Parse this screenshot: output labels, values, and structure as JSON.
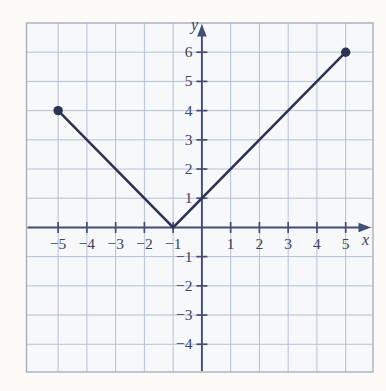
{
  "figure": {
    "width": 386,
    "height": 391,
    "background": "#fcfbf7",
    "paper_color": "#f6f8fa",
    "frame_color": "#a8aeba",
    "grid_color": "#b5c0d7",
    "axis_color": "#434d75",
    "tick_color": "#434d75",
    "curve_color": "#2d3255",
    "label_color": "#3b425f",
    "plot": {
      "left": 26.5,
      "top": 23,
      "right": 373,
      "bottom": 372
    }
  },
  "chart_data": {
    "type": "line",
    "title": "",
    "xlabel": "x",
    "ylabel": "y",
    "grid": true,
    "legend_position": "none",
    "x_axis": {
      "min": -6.1,
      "max": 5.95,
      "ticks": [
        {
          "v": -5,
          "label": "−5"
        },
        {
          "v": -4,
          "label": "−4"
        },
        {
          "v": -3,
          "label": "−3"
        },
        {
          "v": -2,
          "label": "−2"
        },
        {
          "v": -1,
          "label": "−1"
        },
        {
          "v": 1,
          "label": "1"
        },
        {
          "v": 2,
          "label": "2"
        },
        {
          "v": 3,
          "label": "3"
        },
        {
          "v": 4,
          "label": "4"
        },
        {
          "v": 5,
          "label": "5"
        }
      ]
    },
    "y_axis": {
      "min": -4.95,
      "max": 7.0,
      "ticks": [
        {
          "v": 6,
          "label": "6"
        },
        {
          "v": 5,
          "label": "5"
        },
        {
          "v": 4,
          "label": "4"
        },
        {
          "v": 3,
          "label": "3"
        },
        {
          "v": 2,
          "label": "2"
        },
        {
          "v": 1,
          "label": "1"
        },
        {
          "v": -1,
          "label": "−1"
        },
        {
          "v": -2,
          "label": "−2"
        },
        {
          "v": -3,
          "label": "−3"
        },
        {
          "v": -4,
          "label": "−4"
        }
      ]
    },
    "x_gridlines": [
      -5,
      -4,
      -3,
      -2,
      -1,
      0,
      1,
      2,
      3,
      4,
      5
    ],
    "y_gridlines": [
      -4,
      -3,
      -2,
      -1,
      0,
      1,
      2,
      3,
      4,
      5,
      6
    ],
    "series": [
      {
        "name": "piecewise-linear-v-graph",
        "points": [
          [
            -5,
            4
          ],
          [
            -1,
            0
          ],
          [
            5,
            6
          ]
        ]
      }
    ],
    "endpoint_dots": [
      [
        -5,
        4
      ],
      [
        5,
        6
      ]
    ],
    "vertex": [
      -1,
      0
    ],
    "y_intercept": [
      0,
      1
    ]
  }
}
